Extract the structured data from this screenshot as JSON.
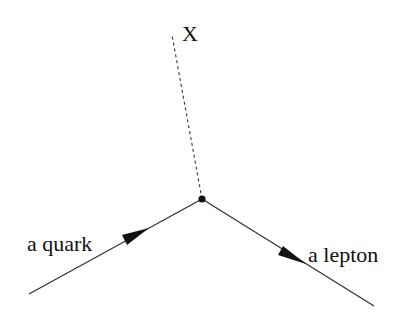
{
  "diagram": {
    "type": "feynman-vertex",
    "labels": {
      "boson": "X",
      "incoming": "a quark",
      "outgoing": "a lepton"
    },
    "vertex": {
      "x": 202,
      "y": 199
    },
    "lines": [
      {
        "name": "quark-line",
        "from": [
          29,
          294
        ],
        "to": [
          202,
          199
        ],
        "style": "solid",
        "arrow": "toward-vertex"
      },
      {
        "name": "lepton-line",
        "from": [
          202,
          199
        ],
        "to": [
          374,
          306
        ],
        "style": "solid",
        "arrow": "away-from-vertex"
      },
      {
        "name": "x-boson-line",
        "from": [
          202,
          199
        ],
        "to": [
          172,
          35
        ],
        "style": "dashed",
        "arrow": "none"
      }
    ],
    "colors": {
      "line": "#333333",
      "text": "#111111",
      "background": "#ffffff"
    }
  }
}
